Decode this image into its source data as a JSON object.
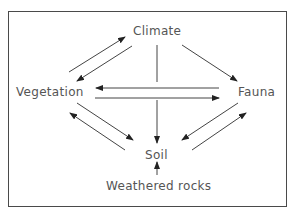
{
  "diagram": {
    "nodes": {
      "climate": "Climate",
      "vegetation": "Vegetation",
      "fauna": "Fauna",
      "soil": "Soil",
      "weathered_rocks": "Weathered rocks"
    },
    "edges": [
      {
        "from": "Vegetation",
        "to": "Climate"
      },
      {
        "from": "Climate",
        "to": "Vegetation"
      },
      {
        "from": "Climate",
        "to": "Fauna"
      },
      {
        "from": "Climate",
        "to": "Soil"
      },
      {
        "from": "Fauna",
        "to": "Vegetation"
      },
      {
        "from": "Vegetation",
        "to": "Fauna"
      },
      {
        "from": "Vegetation",
        "to": "Soil"
      },
      {
        "from": "Soil",
        "to": "Vegetation"
      },
      {
        "from": "Fauna",
        "to": "Soil"
      },
      {
        "from": "Soil",
        "to": "Fauna"
      },
      {
        "from": "Weathered rocks",
        "to": "Soil"
      }
    ],
    "colors": {
      "line": "#333333",
      "text": "#555555",
      "frame": "#4a4a4a"
    }
  }
}
